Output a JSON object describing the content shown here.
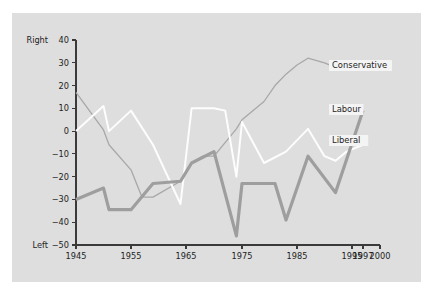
{
  "figure": {
    "background_color": "#ffffff",
    "panel_color": "#dedede",
    "axis_color": "#3a3a3a"
  },
  "axis": {
    "y_top_label": "Right",
    "y_bottom_label": "Left",
    "y_ticks": [
      40,
      30,
      20,
      10,
      0,
      -10,
      -20,
      -30,
      -40,
      -50
    ],
    "x_ticks": [
      1945,
      1955,
      1965,
      1975,
      1985,
      1995,
      1997,
      2000
    ]
  },
  "legend": {
    "items": [
      {
        "label": "Conservative",
        "color": "#a8a8a8",
        "x": 332,
        "y": 68
      },
      {
        "label": "Labour",
        "color": "#9e9e9e",
        "x": 332,
        "y": 112
      },
      {
        "label": "Liberal",
        "color": "#fdfdfd",
        "x": 332,
        "y": 143
      }
    ]
  },
  "chart_data": {
    "type": "line",
    "title": "",
    "xlabel": "",
    "ylabel": "",
    "xlim": [
      1945,
      2000
    ],
    "ylim": [
      -50,
      40
    ],
    "grid": false,
    "legend_position": "right-inline",
    "y_axis_poles": {
      "top": "Right",
      "bottom": "Left"
    },
    "x": [
      1945,
      1950,
      1951,
      1955,
      1959,
      1964,
      1966,
      1970,
      1974,
      1979,
      1983,
      1987,
      1992,
      1997
    ],
    "series": [
      {
        "name": "Conservative",
        "color": "#a8a8a8",
        "width": 1.3,
        "values": [
          17,
          0.5,
          -6,
          -17,
          -29,
          -22,
          -14,
          -11,
          1,
          13,
          25,
          32,
          28,
          31
        ]
      },
      {
        "name": "Labour",
        "color": "#9e9e9e",
        "width": 3.2,
        "values": [
          -30,
          -25,
          -34.5,
          -34.5,
          -23,
          -22,
          -14,
          -9,
          -46,
          -23,
          -23,
          -39,
          -11,
          9
        ]
      },
      {
        "name": "Liberal",
        "color": "#fdfdfd",
        "width": 2.0,
        "values": [
          0,
          11,
          0,
          9,
          -6,
          -32,
          10,
          10,
          -20,
          4,
          -14,
          1,
          -13,
          -6
        ]
      }
    ],
    "series_dense": {
      "note": "Annual plotted polyline vertices as read from the pixels",
      "Conservative": [
        [
          1945,
          17
        ],
        [
          1950,
          0.5
        ],
        [
          1951,
          -6
        ],
        [
          1955,
          -17
        ],
        [
          1957,
          -29
        ],
        [
          1959,
          -29
        ],
        [
          1964,
          -22
        ],
        [
          1966,
          -14
        ],
        [
          1968,
          -11
        ],
        [
          1970,
          -11
        ],
        [
          1974,
          1
        ],
        [
          1975,
          5
        ],
        [
          1979,
          13
        ],
        [
          1981,
          20
        ],
        [
          1983,
          25
        ],
        [
          1985,
          29
        ],
        [
          1987,
          32
        ],
        [
          1990,
          30
        ],
        [
          1992,
          28
        ],
        [
          1994,
          29
        ],
        [
          1997,
          31
        ]
      ],
      "Labour": [
        [
          1945,
          -30
        ],
        [
          1950,
          -25
        ],
        [
          1951,
          -34.5
        ],
        [
          1955,
          -34.5
        ],
        [
          1959,
          -23
        ],
        [
          1964,
          -22
        ],
        [
          1966,
          -14
        ],
        [
          1970,
          -9
        ],
        [
          1974,
          -46
        ],
        [
          1975,
          -23
        ],
        [
          1979,
          -23
        ],
        [
          1981,
          -23
        ],
        [
          1983,
          -39
        ],
        [
          1987,
          -11
        ],
        [
          1992,
          -27
        ],
        [
          1997,
          9
        ]
      ],
      "Liberal": [
        [
          1945,
          0
        ],
        [
          1950,
          11
        ],
        [
          1951,
          0
        ],
        [
          1955,
          9
        ],
        [
          1959,
          -6
        ],
        [
          1964,
          -32
        ],
        [
          1966,
          10
        ],
        [
          1970,
          10
        ],
        [
          1972,
          9
        ],
        [
          1974,
          -20
        ],
        [
          1975,
          4
        ],
        [
          1979,
          -14
        ],
        [
          1983,
          -9
        ],
        [
          1987,
          1
        ],
        [
          1990,
          -11
        ],
        [
          1992,
          -13
        ],
        [
          1994,
          -9
        ],
        [
          1997,
          -6
        ]
      ]
    }
  },
  "geometry": {
    "plot_left": 76,
    "plot_right": 380,
    "plot_top": 40,
    "plot_bottom": 245,
    "x_tick_positions": [
      {
        "year": 1945,
        "px": 76
      },
      {
        "year": 1955,
        "px": 131
      },
      {
        "year": 1965,
        "px": 186
      },
      {
        "year": 1975,
        "px": 242
      },
      {
        "year": 1985,
        "px": 297
      },
      {
        "year": 1995,
        "px": 352
      },
      {
        "year": 1997,
        "px": 363
      },
      {
        "year": 2000,
        "px": 380
      }
    ]
  }
}
